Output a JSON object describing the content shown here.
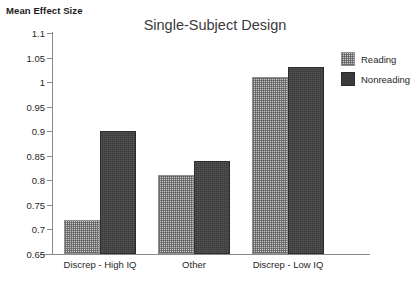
{
  "chart_data": {
    "type": "bar",
    "title": "Single-Subject Design",
    "xlabel": "",
    "ylabel": "Mean Effect Size",
    "categories": [
      "Discrep - High IQ",
      "Other",
      "Discrep - Low IQ"
    ],
    "series": [
      {
        "name": "Reading",
        "values": [
          0.72,
          0.81,
          1.01
        ],
        "color": "#c8c8c8",
        "fill": "checkered-light"
      },
      {
        "name": "Nonreading",
        "values": [
          0.9,
          0.84,
          1.03
        ],
        "color": "#3b3b3b",
        "fill": "solid-dark"
      }
    ],
    "ylim": [
      0.65,
      1.1
    ],
    "yticks": [
      "0.65",
      "0.7",
      "0.75",
      "0.8",
      "0.85",
      "0.9",
      "0.95",
      "1",
      "1.05",
      "1.1"
    ],
    "ytick_values": [
      0.65,
      0.7,
      0.75,
      0.8,
      0.85,
      0.9,
      0.95,
      1.0,
      1.05,
      1.1
    ],
    "grid": false,
    "legend_position": "right-top"
  },
  "legend": {
    "entries": [
      {
        "label": "Reading"
      },
      {
        "label": "Nonreading"
      }
    ]
  }
}
